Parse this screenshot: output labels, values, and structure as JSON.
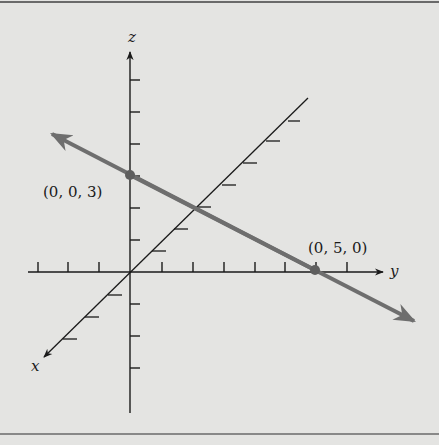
{
  "figure": {
    "axes": {
      "x_label": "x",
      "y_label": "y",
      "z_label": "z"
    },
    "points": [
      {
        "label": "(0, 0, 3)",
        "coords": [
          0,
          0,
          3
        ]
      },
      {
        "label": "(0, 5, 0)",
        "coords": [
          0,
          5,
          0
        ]
      }
    ],
    "line_color": "#6e6e6e",
    "axis_color": "#1a1a1a",
    "background": "#e4e4e2"
  }
}
